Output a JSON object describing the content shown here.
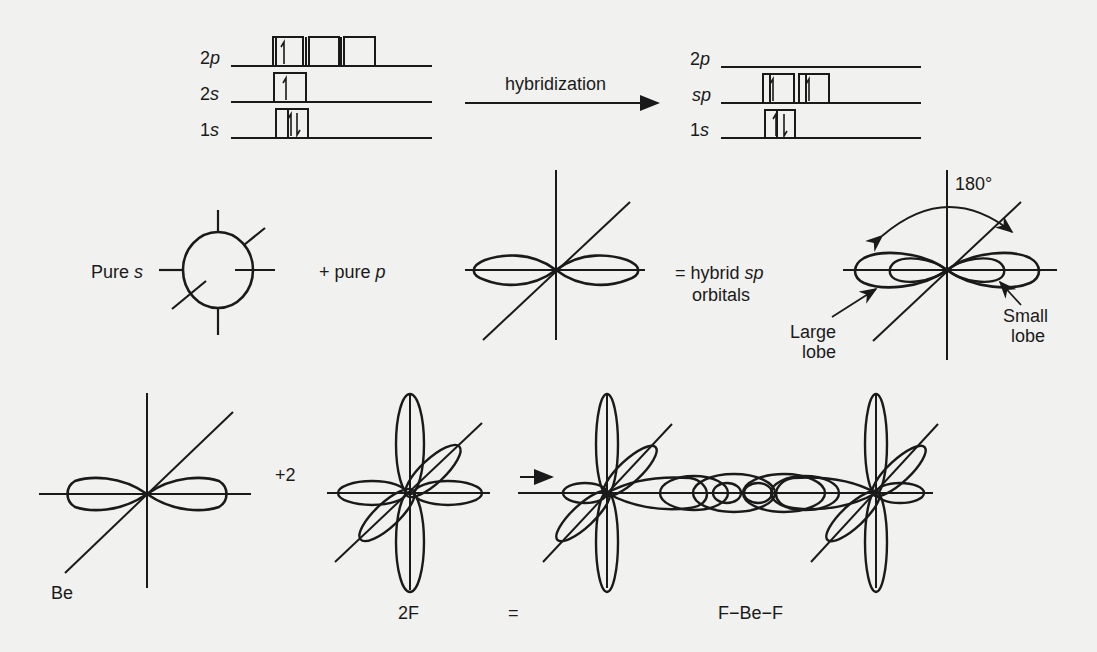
{
  "ground_state": {
    "levels": [
      {
        "label_num": "2",
        "label_orb": "p",
        "boxes": 3,
        "electrons": [
          "up",
          "",
          ""
        ]
      },
      {
        "label_num": "2",
        "label_orb": "s",
        "boxes": 1,
        "electrons": [
          "up"
        ]
      },
      {
        "label_num": "1",
        "label_orb": "s",
        "boxes": 1,
        "electrons": [
          "updown"
        ]
      }
    ]
  },
  "process_arrow": {
    "label": "hybridization"
  },
  "hybridized_state": {
    "levels": [
      {
        "label_num": "2",
        "label_orb": "p",
        "boxes": 0,
        "electrons": []
      },
      {
        "label_num": "",
        "label_orb": "sp",
        "boxes": 2,
        "electrons": [
          "up",
          "up"
        ]
      },
      {
        "label_num": "1",
        "label_orb": "s",
        "boxes": 1,
        "electrons": [
          "updown"
        ]
      }
    ]
  },
  "orbital_row": {
    "pure_s_label": "Pure",
    "pure_s_orb": "s",
    "pure_p_label": "+ pure",
    "pure_p_orb": "p",
    "hybrid_line1_prefix": "= hybrid",
    "hybrid_line1_orb": "sp",
    "hybrid_line2": "orbitals",
    "angle_label": "180°",
    "large_lobe_line1": "Large",
    "large_lobe_line2": "lobe",
    "small_lobe_line1": "Small",
    "small_lobe_line2": "lobe"
  },
  "bonding_row": {
    "be_label": "Be",
    "plus_label": "+2",
    "f_label": "2F",
    "equals_label": "=",
    "product_label": "F−Be−F"
  }
}
